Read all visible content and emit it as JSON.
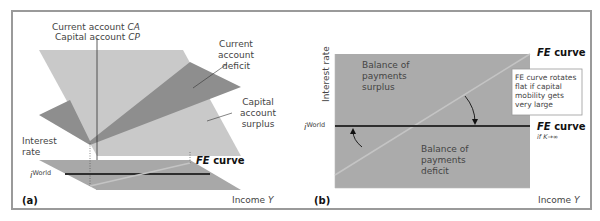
{
  "figure": {
    "panel_a": {
      "tag": "(a)",
      "vertical_axis_label_line1": "Current account ",
      "vertical_axis_label_line1_var": "CA",
      "vertical_axis_label_line2": "Capital account ",
      "vertical_axis_label_line2_var": "CP",
      "interest_rate_label_line1": "Interest",
      "interest_rate_label_line2": "rate",
      "i_world_label": "i",
      "i_world_superscript": "World",
      "income_label": "Income ",
      "income_var": "Y",
      "fe_curve_bold": "FE",
      "fe_curve_text": " curve",
      "current_account_deficit": [
        "Current",
        "account",
        "deficit"
      ],
      "capital_account_surplus": [
        "Capital",
        "account",
        "surplus"
      ]
    },
    "panel_b": {
      "tag": "(b)",
      "interest_rate_label": "Interest rate",
      "i_world_label": "i",
      "i_world_superscript": "World",
      "income_label": "Income ",
      "income_var": "Y",
      "fe_curve_top_bold": "FE",
      "fe_curve_top_text": " curve",
      "fe_curve_flat_bold": "FE",
      "fe_curve_flat_text": " curve",
      "fe_curve_flat_condition": "if K→∞",
      "bop_surplus": [
        "Balance of",
        "payments",
        "surplus"
      ],
      "bop_deficit": [
        "Balance of",
        "payments",
        "deficit"
      ],
      "annotation": [
        "FE curve rotates",
        "flat if capital",
        "mobility gets",
        "very large"
      ]
    },
    "colors": {
      "light_plane": "#c9c9c9",
      "dark_plane": "#8e8e8e",
      "panel_b_fill": "#ababab",
      "fe_line_light": "#c4c4c4",
      "world_line": "#2e2e2e",
      "frame": "#9a9a9a"
    }
  }
}
